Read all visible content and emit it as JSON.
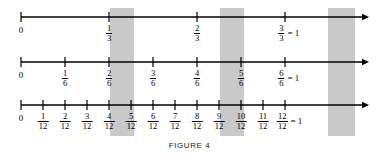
{
  "figure": {
    "caption": "FIGURE 4",
    "accent_band_color": "#c9c9c9",
    "line_color": "#000000",
    "background_color": "#ffffff"
  },
  "geometry": {
    "axis_start_x": 21,
    "axis_end_x": 359,
    "arrow_tip_x": 369,
    "unit_span_px": 264,
    "line_y": [
      17,
      62,
      105
    ],
    "tick_half_height": 5,
    "bands": [
      {
        "x": 110,
        "width": 24
      },
      {
        "x": 220,
        "width": 24
      },
      {
        "x": 328,
        "width": 27
      }
    ],
    "band_top": 8,
    "band_bottom": 136,
    "caption_y": 141
  },
  "lines": [
    {
      "id": "thirds",
      "denominator": 3,
      "label": "thirds-number-line",
      "ticks": [
        {
          "value": 0,
          "x": 21,
          "zero": true,
          "text": "0",
          "numerator": null,
          "denominator": null,
          "equals_one": false,
          "highlighted": false
        },
        {
          "value": 1,
          "x": 109,
          "zero": false,
          "text": null,
          "numerator": "1",
          "denominator": "3",
          "equals_one": false,
          "highlighted": true
        },
        {
          "value": 2,
          "x": 197,
          "zero": false,
          "text": null,
          "numerator": "2",
          "denominator": "3",
          "equals_one": false,
          "highlighted": true
        },
        {
          "value": 3,
          "x": 285,
          "zero": false,
          "text": null,
          "numerator": "3",
          "denominator": "3",
          "equals_one": true,
          "highlighted": true
        }
      ]
    },
    {
      "id": "sixths",
      "denominator": 6,
      "label": "sixths-number-line",
      "ticks": [
        {
          "value": 0,
          "x": 21,
          "zero": true,
          "text": "0",
          "numerator": null,
          "denominator": null,
          "equals_one": false,
          "highlighted": false
        },
        {
          "value": 1,
          "x": 65,
          "zero": false,
          "text": null,
          "numerator": "1",
          "denominator": "6",
          "equals_one": false,
          "highlighted": false
        },
        {
          "value": 2,
          "x": 109,
          "zero": false,
          "text": null,
          "numerator": "2",
          "denominator": "6",
          "equals_one": false,
          "highlighted": true
        },
        {
          "value": 3,
          "x": 153,
          "zero": false,
          "text": null,
          "numerator": "3",
          "denominator": "6",
          "equals_one": false,
          "highlighted": false
        },
        {
          "value": 4,
          "x": 197,
          "zero": false,
          "text": null,
          "numerator": "4",
          "denominator": "6",
          "equals_one": false,
          "highlighted": true
        },
        {
          "value": 5,
          "x": 241,
          "zero": false,
          "text": null,
          "numerator": "5",
          "denominator": "6",
          "equals_one": false,
          "highlighted": false
        },
        {
          "value": 6,
          "x": 285,
          "zero": false,
          "text": null,
          "numerator": "6",
          "denominator": "6",
          "equals_one": true,
          "highlighted": true
        }
      ]
    },
    {
      "id": "twelfths",
      "denominator": 12,
      "label": "twelfths-number-line",
      "ticks": [
        {
          "value": 0,
          "x": 21,
          "zero": true,
          "text": "0",
          "numerator": null,
          "denominator": null,
          "equals_one": false,
          "highlighted": false
        },
        {
          "value": 1,
          "x": 43,
          "zero": false,
          "text": null,
          "numerator": "1",
          "denominator": "12",
          "equals_one": false,
          "highlighted": false
        },
        {
          "value": 2,
          "x": 65,
          "zero": false,
          "text": null,
          "numerator": "2",
          "denominator": "12",
          "equals_one": false,
          "highlighted": false
        },
        {
          "value": 3,
          "x": 87,
          "zero": false,
          "text": null,
          "numerator": "3",
          "denominator": "12",
          "equals_one": false,
          "highlighted": false
        },
        {
          "value": 4,
          "x": 109,
          "zero": false,
          "text": null,
          "numerator": "4",
          "denominator": "12",
          "equals_one": false,
          "highlighted": true
        },
        {
          "value": 5,
          "x": 131,
          "zero": false,
          "text": null,
          "numerator": "5",
          "denominator": "12",
          "equals_one": false,
          "highlighted": false
        },
        {
          "value": 6,
          "x": 153,
          "zero": false,
          "text": null,
          "numerator": "6",
          "denominator": "12",
          "equals_one": false,
          "highlighted": false
        },
        {
          "value": 7,
          "x": 175,
          "zero": false,
          "text": null,
          "numerator": "7",
          "denominator": "12",
          "equals_one": false,
          "highlighted": false
        },
        {
          "value": 8,
          "x": 197,
          "zero": false,
          "text": null,
          "numerator": "8",
          "denominator": "12",
          "equals_one": false,
          "highlighted": true
        },
        {
          "value": 9,
          "x": 219,
          "zero": false,
          "text": null,
          "numerator": "9",
          "denominator": "12",
          "equals_one": false,
          "highlighted": false
        },
        {
          "value": 10,
          "x": 241,
          "zero": false,
          "text": null,
          "numerator": "10",
          "denominator": "12",
          "equals_one": false,
          "highlighted": false
        },
        {
          "value": 11,
          "x": 263,
          "zero": false,
          "text": null,
          "numerator": "11",
          "denominator": "12",
          "equals_one": false,
          "highlighted": false
        },
        {
          "value": 12,
          "x": 285,
          "zero": false,
          "text": null,
          "numerator": "12",
          "denominator": "12",
          "equals_one": true,
          "highlighted": true
        }
      ]
    }
  ],
  "equals_one_text": "= 1",
  "chart_data": {
    "type": "line",
    "title": "FIGURE 4",
    "xlabel": "",
    "ylabel": "",
    "xlim": [
      0,
      1
    ],
    "grid": false,
    "series": [
      {
        "name": "thirds",
        "values": [
          0,
          0.3333,
          0.6667,
          1
        ],
        "tick_labels": [
          "0",
          "1/3",
          "2/3",
          "3/3 = 1"
        ]
      },
      {
        "name": "sixths",
        "values": [
          0,
          0.1667,
          0.3333,
          0.5,
          0.6667,
          0.8333,
          1
        ],
        "tick_labels": [
          "0",
          "1/6",
          "2/6",
          "3/6",
          "4/6",
          "5/6",
          "6/6 = 1"
        ]
      },
      {
        "name": "twelfths",
        "values": [
          0,
          0.0833,
          0.1667,
          0.25,
          0.3333,
          0.4167,
          0.5,
          0.5833,
          0.6667,
          0.75,
          0.8333,
          0.9167,
          1
        ],
        "tick_labels": [
          "0",
          "1/12",
          "2/12",
          "3/12",
          "4/12",
          "5/12",
          "6/12",
          "7/12",
          "8/12",
          "9/12",
          "10/12",
          "11/12",
          "12/12 = 1"
        ]
      }
    ],
    "annotations": [
      {
        "label": "equivalence band 1",
        "x": 0.3333,
        "fractions": [
          "1/3",
          "2/6",
          "4/12"
        ]
      },
      {
        "label": "equivalence band 2",
        "x": 0.6667,
        "fractions": [
          "2/3",
          "4/6",
          "8/12"
        ]
      },
      {
        "label": "equivalence band 3",
        "x": 1.0,
        "fractions": [
          "3/3",
          "6/6",
          "12/12"
        ]
      }
    ]
  }
}
